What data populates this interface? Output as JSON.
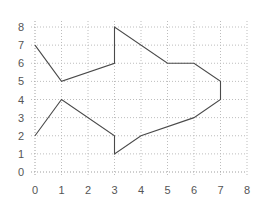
{
  "chart_data": {
    "type": "line",
    "title": "",
    "xlabel": "",
    "ylabel": "",
    "xlim": [
      0,
      8
    ],
    "ylim": [
      0,
      8
    ],
    "grid": true,
    "legend": null,
    "x_ticks": [
      "0",
      "1",
      "2",
      "3",
      "4",
      "5",
      "6",
      "7",
      "8"
    ],
    "y_ticks": [
      "0",
      "1",
      "2",
      "3",
      "4",
      "5",
      "6",
      "7",
      "8"
    ],
    "series": [
      {
        "name": "outline",
        "closed": false,
        "points": [
          [
            0,
            7
          ],
          [
            1,
            5
          ],
          [
            3,
            6
          ],
          [
            3,
            8
          ],
          [
            5,
            6
          ],
          [
            6,
            6
          ],
          [
            7,
            5
          ],
          [
            7,
            4
          ],
          [
            6,
            3
          ],
          [
            4,
            2
          ],
          [
            3,
            1
          ],
          [
            3,
            2
          ],
          [
            1,
            4
          ],
          [
            0,
            2
          ]
        ]
      }
    ],
    "colors": {
      "line": "#4a4a4a",
      "grid": "#bdbdbd",
      "axis": "#9e9e9e",
      "tick_label": "#555555",
      "background": "#ffffff"
    }
  }
}
